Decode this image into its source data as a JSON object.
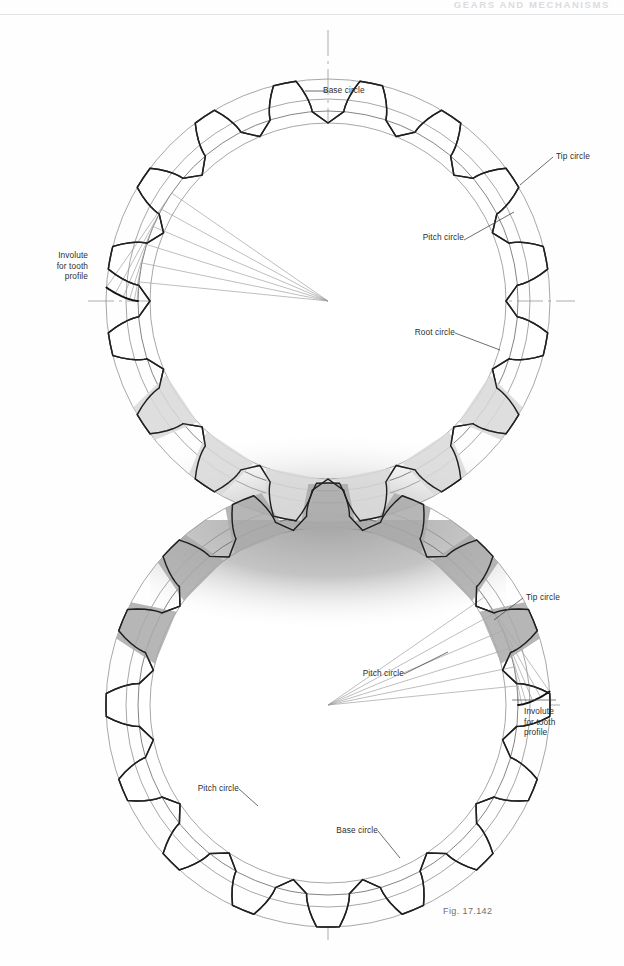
{
  "page": {
    "running_head": "GEARS AND MECHANISMS",
    "caption": "Fig. 17.142",
    "background_color": "#ffffff",
    "rule_color": "#e3e3e5"
  },
  "labels": {
    "base_circle_top": "Base circle",
    "tip_circle_top": "Tip circle",
    "pitch_circle_top": "Pitch circle",
    "root_circle_top": "Root circle",
    "involute_top_line1": "Involute",
    "involute_top_line2": "for tooth",
    "involute_top_line3": "profile",
    "tip_circle_bottom": "Tip circle",
    "pitch_circle_bottom_right": "Pitch circle",
    "involute_bottom_line1": "Involute",
    "involute_bottom_line2": "for tooth",
    "involute_bottom_line3": "profile",
    "pitch_circle_bottom_left": "Pitch circle",
    "base_circle_bottom": "Base circle"
  },
  "chart_data": {
    "type": "diagram",
    "units": "pixels",
    "gears": [
      {
        "name": "upper-gear",
        "center": [
          328,
          301
        ],
        "tip_radius": 222,
        "pitch_radius": 202,
        "base_radius": 190,
        "root_radius": 178,
        "teeth": 16,
        "tooth_phase_deg": 11.25,
        "involute_start_angle_deg": 180,
        "construction_rays_deg": [
          180,
          168,
          156,
          144,
          132,
          120
        ],
        "label_anchor_involute": [
          100,
          292
        ]
      },
      {
        "name": "lower-gear",
        "center": [
          328,
          705
        ],
        "tip_radius": 222,
        "pitch_radius": 202,
        "base_radius": 190,
        "root_radius": 178,
        "teeth": 16,
        "tooth_phase_deg": 0,
        "involute_start_angle_deg": 0,
        "construction_rays_deg": [
          0,
          12,
          24,
          36,
          48,
          60
        ],
        "label_anchor_involute": [
          512,
          706
        ]
      }
    ],
    "center_distance": 404,
    "circle_names": [
      "Tip circle",
      "Pitch circle",
      "Base circle",
      "Root circle"
    ],
    "colors": {
      "outline": "#3a3a3a",
      "thin_line": "#8a8a8a",
      "construction": "#9b9b9b",
      "tooth_fill_light": "#d8d8d8",
      "tooth_fill_dark": "#a9a9a9",
      "shadow": "#c9c9c9",
      "centerline": "#9a9a9a",
      "label_text": "#2e2e2e"
    },
    "axis_lines": {
      "vertical_centerline": {
        "x": 328,
        "y_from": 30,
        "y_to": 940
      },
      "horizontal_top": {
        "y": 301,
        "x_from": 88,
        "x_to": 575
      },
      "horizontal_bottom": {
        "y": 705,
        "x_from": 115,
        "x_to": 560
      }
    }
  }
}
